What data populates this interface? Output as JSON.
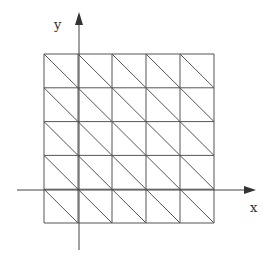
{
  "diagram": {
    "type": "triangulated-grid-mesh",
    "axes": {
      "x_label": "x",
      "y_label": "y"
    },
    "grid": {
      "columns": 5,
      "rows": 5,
      "diagonal_direction": "top-left-to-bottom-right"
    },
    "colors": {
      "line": "#555555",
      "axis": "#444444",
      "background": "#ffffff"
    }
  }
}
